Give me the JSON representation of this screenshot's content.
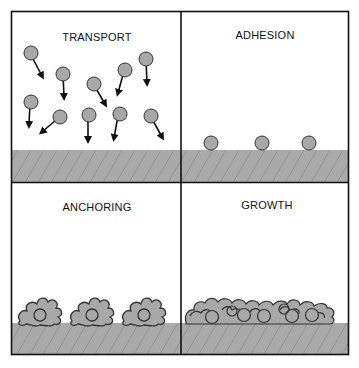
{
  "figure": {
    "panels": [
      {
        "id": "transport",
        "label": "TRANSPORT",
        "description": "Particles with arrows moving toward the surface"
      },
      {
        "id": "adhesion",
        "label": "ADHESION",
        "description": "Three particles resting on the surface"
      },
      {
        "id": "anchoring",
        "label": "ANCHORING",
        "description": "Three cells spread and anchored on the surface"
      },
      {
        "id": "growth",
        "label": "GROWTH",
        "description": "Dense layer of cells covering the surface"
      }
    ],
    "colors": {
      "border": "#111111",
      "particle_fill": "#a8a8a8",
      "particle_stroke": "#333333",
      "substrate_fill": "#a9a9a9",
      "hatch_line": "#777777",
      "background": "#ffffff"
    }
  }
}
